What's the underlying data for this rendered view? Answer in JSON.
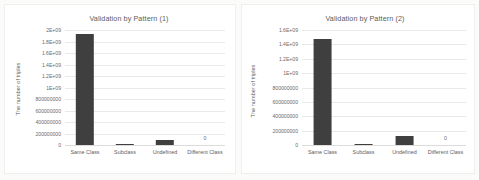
{
  "figure": {
    "background_color": "#fbfbfa",
    "panel_background": "#ffffff",
    "bar_color": "#3f3f3f",
    "gridline_color": "#e9e9e7"
  },
  "chart_data": [
    {
      "type": "bar",
      "title": "Validation by Pattern (1)",
      "xlabel": "",
      "ylabel": "The number of triples",
      "categories": [
        "Same Class",
        "Subclass",
        "Undefined",
        "Different Class"
      ],
      "values": [
        1930000000,
        22000000,
        95000000,
        0
      ],
      "data_labels": [
        "",
        "",
        "",
        "0"
      ],
      "ylim": [
        0,
        2000000000
      ],
      "yticks": [
        0,
        200000000,
        400000000,
        600000000,
        800000000,
        1000000000,
        1200000000,
        1400000000,
        1600000000,
        1800000000,
        2000000000
      ],
      "ytick_labels": [
        "0",
        "200000000",
        "400000000",
        "600000000",
        "800000000",
        "1E+09",
        "1.2E+09",
        "1.4E+09",
        "1.6E+09",
        "1.8E+09",
        "2E+09"
      ],
      "grid": true,
      "legend": false
    },
    {
      "type": "bar",
      "title": "Validation by Pattern (2)",
      "xlabel": "",
      "ylabel": "The number of triples",
      "categories": [
        "Same Class",
        "Subclass",
        "Undefined",
        "Different Class"
      ],
      "values": [
        1470000000,
        18000000,
        120000000,
        0
      ],
      "data_labels": [
        "",
        "",
        "",
        "0"
      ],
      "ylim": [
        0,
        1600000000
      ],
      "yticks": [
        0,
        200000000,
        400000000,
        600000000,
        800000000,
        1000000000,
        1200000000,
        1400000000,
        1600000000
      ],
      "ytick_labels": [
        "0",
        "200000000",
        "400000000",
        "600000000",
        "800000000",
        "1E+09",
        "1.2E+09",
        "1.4E+09",
        "1.6E+09"
      ],
      "grid": true,
      "legend": false
    }
  ]
}
